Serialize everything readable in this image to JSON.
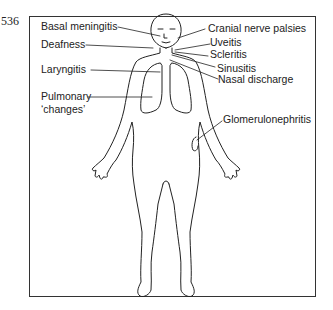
{
  "figure": {
    "number": "536",
    "labels": {
      "basal_meningitis": "Basal meningitis",
      "deafness": "Deafness",
      "laryngitis": "Laryngitis",
      "pulmonary_line1": "Pulmonary",
      "pulmonary_line2": "‘changes’",
      "cranial_nerve_palsies": "Cranial nerve palsies",
      "uveitis": "Uveitis",
      "scleritis": "Scleritis",
      "sinusitis": "Sinusitis",
      "nasal_discharge": "Nasal discharge",
      "glomerulonephritis": "Glomerulonephritis"
    }
  }
}
